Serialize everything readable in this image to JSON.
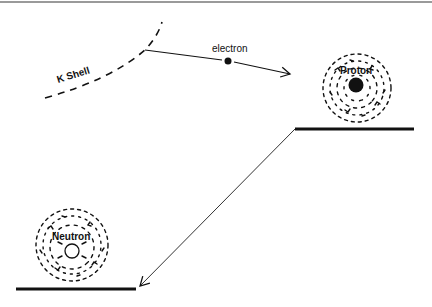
{
  "diagram": {
    "labels": {
      "k_shell": "K Shell",
      "electron": "electron",
      "proton": "Proton",
      "neutron": "Neutron"
    },
    "colors": {
      "ink": "#111111",
      "top_rule": "#9a9a9a",
      "background": "#ffffff"
    },
    "elements": {
      "k_shell_curve": {
        "style": "dashed",
        "from": [
          45,
          98
        ],
        "to": [
          162,
          22
        ]
      },
      "electron_path": {
        "from": [
          145,
          50
        ],
        "to": [
          290,
          74
        ],
        "arrow": "end"
      },
      "electron_dot": {
        "cx": 228,
        "cy": 61,
        "r": 3.5
      },
      "proton_cloud": {
        "cx": 357,
        "cy": 88,
        "r": 35
      },
      "proton_nucleus": {
        "cx": 356,
        "cy": 85,
        "r": 7,
        "fill": "solid"
      },
      "upper_level": {
        "x1": 295,
        "x2": 414,
        "y": 129
      },
      "transition_arrow": {
        "from": [
          295,
          129
        ],
        "to": [
          140,
          287
        ],
        "arrow": "end"
      },
      "neutron_cloud": {
        "cx": 72,
        "cy": 245,
        "r": 37
      },
      "neutron_nucleus": {
        "cx": 72,
        "cy": 251,
        "r": 7,
        "fill": "open"
      },
      "lower_level": {
        "x1": 16,
        "x2": 136,
        "y": 289
      }
    }
  }
}
